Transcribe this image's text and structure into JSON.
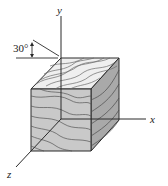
{
  "diagram": {
    "type": "isometric-cube-with-wood-grain",
    "axes": {
      "x_label": "x",
      "y_label": "y",
      "z_label": "z"
    },
    "angle": {
      "label": "30°",
      "value_deg": 30
    },
    "colors": {
      "line": "#2a2a2a",
      "top_face": "#efefef",
      "front_face": "#c9c9c9",
      "side_face": "#a9a9a9",
      "grain": "#5a5a5a"
    }
  }
}
